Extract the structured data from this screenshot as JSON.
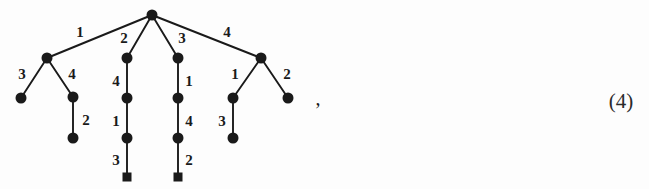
{
  "figure": {
    "kind": "rooted-tree-diagram",
    "background_color": "#fdfdfd",
    "ink_color": "#1a1a1a",
    "width": 649,
    "height": 189
  },
  "equation_number": {
    "label": "(4)",
    "x": 621,
    "y": 101
  },
  "punctuation": {
    "comma": ",",
    "x": 318,
    "y": 98
  },
  "nodes": [
    {
      "id": "root",
      "shape": "disc",
      "x": 152,
      "y": 15,
      "r": 5.5
    },
    {
      "id": "a",
      "shape": "disc",
      "x": 47,
      "y": 58,
      "r": 5.5
    },
    {
      "id": "b",
      "shape": "disc",
      "x": 127,
      "y": 58,
      "r": 5.5
    },
    {
      "id": "c",
      "shape": "disc",
      "x": 178,
      "y": 58,
      "r": 5.5
    },
    {
      "id": "d",
      "shape": "disc",
      "x": 261,
      "y": 58,
      "r": 5.5
    },
    {
      "id": "a1",
      "shape": "disc",
      "x": 21,
      "y": 98,
      "r": 5.5
    },
    {
      "id": "a2",
      "shape": "disc",
      "x": 73,
      "y": 97,
      "r": 5.5
    },
    {
      "id": "b1",
      "shape": "disc",
      "x": 127,
      "y": 98,
      "r": 5.5
    },
    {
      "id": "c1",
      "shape": "disc",
      "x": 178,
      "y": 98,
      "r": 5.5
    },
    {
      "id": "d1",
      "shape": "disc",
      "x": 233,
      "y": 98,
      "r": 5.5
    },
    {
      "id": "d2",
      "shape": "disc",
      "x": 288,
      "y": 98,
      "r": 5.5
    },
    {
      "id": "a2a",
      "shape": "disc",
      "x": 73,
      "y": 138,
      "r": 5.5
    },
    {
      "id": "b2",
      "shape": "disc",
      "x": 127,
      "y": 138,
      "r": 5.5
    },
    {
      "id": "c2",
      "shape": "disc",
      "x": 178,
      "y": 138,
      "r": 5.5
    },
    {
      "id": "d1a",
      "shape": "disc",
      "x": 233,
      "y": 138,
      "r": 5.5
    },
    {
      "id": "b3",
      "shape": "square",
      "x": 127,
      "y": 177,
      "s": 9
    },
    {
      "id": "c3",
      "shape": "square",
      "x": 178,
      "y": 177,
      "s": 9
    }
  ],
  "edges": [
    {
      "from": "root",
      "to": "a",
      "label": "1",
      "label_x": 80,
      "label_y": 32
    },
    {
      "from": "root",
      "to": "b",
      "label": "2",
      "label_x": 124,
      "label_y": 38
    },
    {
      "from": "root",
      "to": "c",
      "label": "3",
      "label_x": 182,
      "label_y": 38
    },
    {
      "from": "root",
      "to": "d",
      "label": "4",
      "label_x": 227,
      "label_y": 32
    },
    {
      "from": "a",
      "to": "a1",
      "label": "3",
      "label_x": 22,
      "label_y": 74
    },
    {
      "from": "a",
      "to": "a2",
      "label": "4",
      "label_x": 72,
      "label_y": 74
    },
    {
      "from": "a2",
      "to": "a2a",
      "label": "2",
      "label_x": 86,
      "label_y": 120
    },
    {
      "from": "b",
      "to": "b1",
      "label": "4",
      "label_x": 116,
      "label_y": 81
    },
    {
      "from": "b1",
      "to": "b2",
      "label": "1",
      "label_x": 116,
      "label_y": 121
    },
    {
      "from": "b2",
      "to": "b3",
      "label": "3",
      "label_x": 116,
      "label_y": 160
    },
    {
      "from": "c",
      "to": "c1",
      "label": "1",
      "label_x": 189,
      "label_y": 81
    },
    {
      "from": "c1",
      "to": "c2",
      "label": "4",
      "label_x": 189,
      "label_y": 121
    },
    {
      "from": "c2",
      "to": "c3",
      "label": "2",
      "label_x": 189,
      "label_y": 160
    },
    {
      "from": "d",
      "to": "d1",
      "label": "1",
      "label_x": 235,
      "label_y": 74
    },
    {
      "from": "d",
      "to": "d2",
      "label": "2",
      "label_x": 287,
      "label_y": 74
    },
    {
      "from": "d1",
      "to": "d1a",
      "label": "3",
      "label_x": 222,
      "label_y": 121
    }
  ]
}
